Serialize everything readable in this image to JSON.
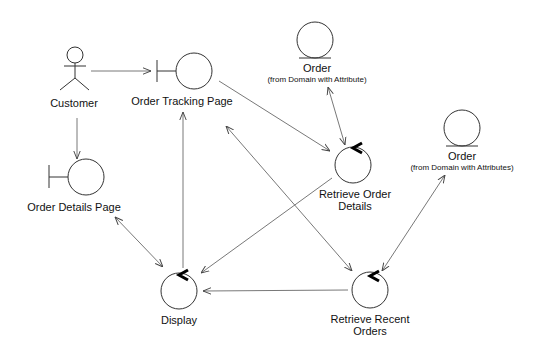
{
  "diagram": {
    "type": "UML robustness / collaboration diagram",
    "nodes": [
      {
        "id": "customer",
        "kind": "actor",
        "label": "Customer"
      },
      {
        "id": "order_tracking_page",
        "kind": "boundary",
        "label": "Order Tracking Page"
      },
      {
        "id": "order_details_page",
        "kind": "boundary",
        "label": "Order Details Page"
      },
      {
        "id": "order_1",
        "kind": "entity",
        "label": "Order",
        "sublabel": "(from Domain with Attribute)"
      },
      {
        "id": "order_2",
        "kind": "entity",
        "label": "Order",
        "sublabel": "(from Domain with Attributes)"
      },
      {
        "id": "retrieve_order_details",
        "kind": "control",
        "label_line1": "Retrieve Order",
        "label_line2": "Details"
      },
      {
        "id": "retrieve_recent_orders",
        "kind": "control",
        "label_line1": "Retrieve Recent",
        "label_line2": "Orders"
      },
      {
        "id": "display",
        "kind": "control",
        "label": "Display"
      }
    ],
    "edges": [
      {
        "from": "customer",
        "to": "order_tracking_page",
        "arrow": "end"
      },
      {
        "from": "customer",
        "to": "order_details_page",
        "arrow": "end"
      },
      {
        "from": "order_tracking_page",
        "to": "retrieve_order_details",
        "arrow": "end"
      },
      {
        "from": "order_1",
        "to": "retrieve_order_details",
        "arrow": "both"
      },
      {
        "from": "order_2",
        "to": "retrieve_recent_orders",
        "arrow": "both"
      },
      {
        "from": "retrieve_order_details",
        "to": "display",
        "arrow": "end"
      },
      {
        "from": "order_tracking_page",
        "to": "retrieve_recent_orders",
        "arrow": "both"
      },
      {
        "from": "display",
        "to": "order_tracking_page",
        "arrow": "end"
      },
      {
        "from": "order_details_page",
        "to": "display",
        "arrow": "both"
      },
      {
        "from": "retrieve_recent_orders",
        "to": "display",
        "arrow": "end"
      }
    ]
  }
}
